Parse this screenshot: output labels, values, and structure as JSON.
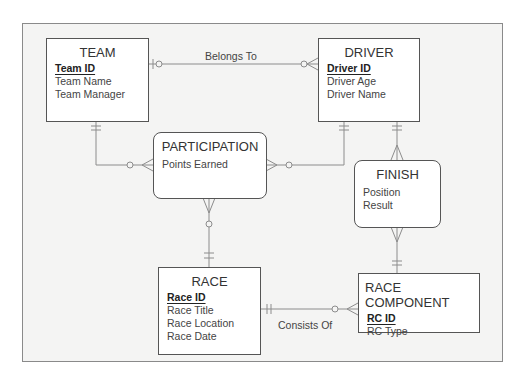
{
  "diagram": {
    "type": "entity-relationship",
    "entities": {
      "team": {
        "title": "TEAM",
        "primary_key": "Team ID",
        "attributes": [
          "Team Name",
          "Team Manager"
        ]
      },
      "driver": {
        "title": "DRIVER",
        "primary_key": "Driver ID",
        "attributes": [
          "Driver Age",
          "Driver Name"
        ]
      },
      "participation": {
        "title": "PARTICIPATION",
        "attributes": [
          "Points Earned"
        ]
      },
      "finish": {
        "title": "FINISH",
        "attributes": [
          "Position",
          "Result"
        ]
      },
      "race": {
        "title": "RACE",
        "primary_key": "Race ID",
        "attributes": [
          "Race Title",
          "Race Location",
          "Race Date"
        ]
      },
      "race_component": {
        "title": "RACE COMPONENT",
        "primary_key": "RC ID",
        "attributes": [
          "RC Type"
        ]
      }
    },
    "relationships": {
      "belongs_to": {
        "label": "Belongs To",
        "from": "TEAM",
        "to": "DRIVER",
        "from_cardinality": "zero-or-one",
        "to_cardinality": "zero-or-many"
      },
      "consists_of": {
        "label": "Consists Of",
        "from": "RACE",
        "to": "RACE COMPONENT",
        "from_cardinality": "exactly-one",
        "to_cardinality": "zero-or-many"
      },
      "team_participation": {
        "from": "TEAM",
        "to": "PARTICIPATION",
        "from_cardinality": "exactly-one",
        "to_cardinality": "zero-or-many"
      },
      "driver_participation": {
        "from": "DRIVER",
        "to": "PARTICIPATION",
        "from_cardinality": "exactly-one",
        "to_cardinality": "zero-or-many"
      },
      "race_participation": {
        "from": "RACE",
        "to": "PARTICIPATION",
        "from_cardinality": "exactly-one",
        "to_cardinality": "zero-or-many"
      },
      "driver_finish": {
        "from": "DRIVER",
        "to": "FINISH",
        "from_cardinality": "exactly-one",
        "to_cardinality": "one-or-many"
      },
      "race_component_finish": {
        "from": "RACE COMPONENT",
        "to": "FINISH",
        "from_cardinality": "exactly-one",
        "to_cardinality": "one-or-many"
      }
    },
    "colors": {
      "line": "#8c8c8c",
      "border": "#555555",
      "background": "#f4f4f3"
    }
  }
}
